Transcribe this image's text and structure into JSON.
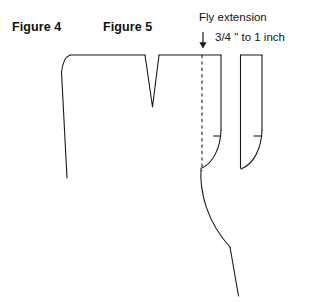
{
  "diagram": {
    "background_color": "#ffffff",
    "line_color": "#1a1a1a",
    "labels": {
      "figure_4": "Figure 4",
      "figure_5": "Figure 5"
    },
    "callout": {
      "title": "Fly extension",
      "measurement": "3/4 \" to 1 inch",
      "arrow_icon": "down-arrow-icon"
    },
    "parts": {
      "trouser_front_name": "trouser-front-pattern-piece",
      "fly_extension_strip_name": "fly-extension-strip",
      "separate_fly_piece_name": "separate-fly-facing-piece",
      "dart_name": "waist-dart-notch",
      "foldline_name": "fly-foldline-dashed",
      "notch_main_name": "fly-notch-mark-main",
      "notch_separate_name": "fly-notch-mark-separate"
    }
  }
}
